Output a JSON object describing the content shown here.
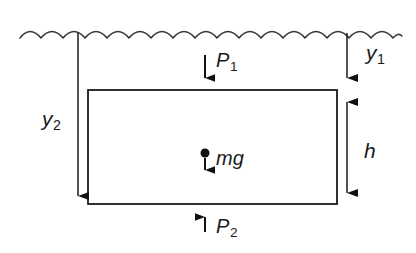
{
  "diagram": {
    "surface": {
      "name": "water-surface",
      "style": "wavy-line",
      "arc_count": 9,
      "x_start": 20,
      "x_end": 400,
      "baseline_y": 33,
      "amplitude": 6,
      "color": "#3a3a3a"
    },
    "block": {
      "name": "submerged-block",
      "shape": "rectangle",
      "left": 88,
      "top": 90,
      "right": 337,
      "bottom": 204,
      "width": 249,
      "height": 114,
      "fill": "none",
      "stroke": "#1a1a1a"
    },
    "colors": {
      "ink": "#1a1a1a",
      "wave": "#3a3a3a",
      "arrow": "#111111",
      "background": "#ffffff"
    },
    "labels": {
      "y1": {
        "base": "y",
        "sub": "1",
        "text": "y1",
        "meaning": "depth-to-top-face"
      },
      "y2": {
        "base": "y",
        "sub": "2",
        "text": "y2",
        "meaning": "depth-to-bottom-face"
      },
      "h": {
        "base": "h",
        "sub": "",
        "text": "h",
        "meaning": "block-height"
      },
      "P1": {
        "base": "P",
        "sub": "1",
        "text": "P1",
        "meaning": "pressure-on-top-face"
      },
      "P2": {
        "base": "P",
        "sub": "2",
        "text": "P2",
        "meaning": "pressure-on-bottom-face"
      },
      "mg": {
        "base": "mg",
        "sub": "",
        "text": "mg",
        "meaning": "weight-at-center-of-mass"
      }
    },
    "measures": [
      {
        "name": "y1-measure",
        "label": "y1",
        "orientation": "vertical",
        "x": 347,
        "from_y": 33,
        "to_y": 88,
        "arrowheads": "end",
        "direction": "down"
      },
      {
        "name": "y2-measure",
        "label": "y2",
        "orientation": "vertical",
        "x": 78,
        "from_y": 33,
        "to_y": 206,
        "arrowheads": "end",
        "direction": "down"
      },
      {
        "name": "h-measure",
        "label": "h",
        "orientation": "vertical",
        "x": 347,
        "from_y": 91,
        "to_y": 203,
        "arrowheads": "both",
        "direction": "both"
      }
    ],
    "forces": [
      {
        "name": "pressure-top-force",
        "label": "P1",
        "x": 205,
        "from_y": 55,
        "to_y": 88,
        "direction": "down"
      },
      {
        "name": "weight-force",
        "label": "mg",
        "x": 205,
        "from_y": 158,
        "to_y": 180,
        "direction": "down",
        "has_center_of_mass_dot": true,
        "dot_y": 153,
        "dot_radius": 4.5
      },
      {
        "name": "pressure-bottom-force",
        "label": "P2",
        "x": 205,
        "from_y": 232,
        "to_y": 207,
        "direction": "up"
      }
    ]
  }
}
